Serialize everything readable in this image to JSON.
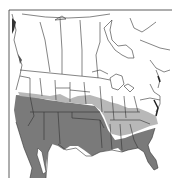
{
  "map": {
    "type": "range-map",
    "region": "North America",
    "legend_colors": {
      "no_range": "#ffffff",
      "peripheral_range": "#b8b8b8",
      "core_range": "#7a7a7a",
      "border": "#333333",
      "water": "#ffffff"
    },
    "shaded_regions": {
      "core_range": [
        "California",
        "Nevada",
        "Arizona",
        "New Mexico",
        "Texas",
        "Oklahoma",
        "Louisiana",
        "Mississippi",
        "Alabama",
        "Georgia",
        "Florida",
        "South Carolina",
        "Utah",
        "Colorado",
        "Kansas",
        "Mexico"
      ],
      "peripheral_range": [
        "Missouri",
        "Arkansas",
        "Tennessee",
        "Kentucky",
        "Illinois",
        "Indiana",
        "Ohio",
        "North Carolina",
        "Virginia",
        "Nebraska",
        "Iowa"
      ]
    }
  }
}
